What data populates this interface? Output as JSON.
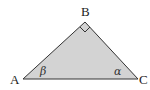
{
  "diagram": {
    "vertices": {
      "A": {
        "label": "A",
        "x": 23,
        "y": 79
      },
      "B": {
        "label": "B",
        "x": 85,
        "y": 22
      },
      "C": {
        "label": "C",
        "x": 138,
        "y": 79
      }
    },
    "right_angle_at": "B",
    "angles": {
      "A": {
        "symbol": "β"
      },
      "C": {
        "symbol": "α"
      }
    },
    "colors": {
      "fill": "#d3d3d3",
      "stroke": "#333333"
    }
  }
}
